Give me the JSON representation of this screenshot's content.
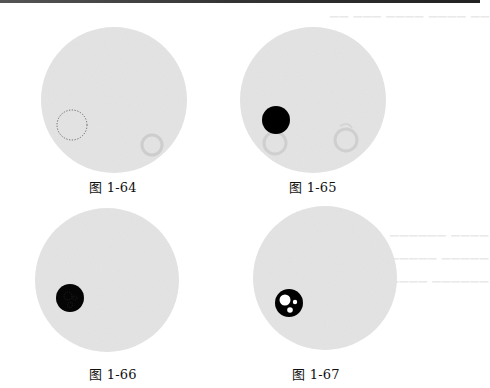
{
  "page": {
    "background": "#ffffff",
    "top_rule_color": "#333333"
  },
  "colors": {
    "disc_fill": "#e4e4e4",
    "disc_texture": "#dadada",
    "mark_black": "#000000",
    "hole_white": "#ffffff",
    "faint_ring": "#c9c9c9",
    "dashed_outline": "#555555"
  },
  "figures": [
    {
      "id": "fig-1-64",
      "caption": "图 1-64",
      "disc": {
        "cx": 114,
        "cy": 100,
        "r": 73
      },
      "mark": {
        "type": "dashed-circle",
        "cx": 72,
        "cy": 125,
        "r": 15
      },
      "faint_rings": [
        {
          "cx": 152,
          "cy": 145,
          "r": 10
        }
      ],
      "caption_pos": {
        "x": 113,
        "y": 184
      }
    },
    {
      "id": "fig-1-65",
      "caption": "图 1-65",
      "disc": {
        "cx": 313,
        "cy": 100,
        "r": 73
      },
      "mark": {
        "type": "filled-circle",
        "cx": 276,
        "cy": 120,
        "r": 14
      },
      "faint_rings": [
        {
          "cx": 275,
          "cy": 143,
          "r": 11
        },
        {
          "cx": 346,
          "cy": 140,
          "r": 11
        }
      ],
      "caption_pos": {
        "x": 313,
        "y": 184
      }
    },
    {
      "id": "fig-1-66",
      "caption": "图 1-66",
      "disc": {
        "cx": 107,
        "cy": 280,
        "r": 72
      },
      "mark": {
        "type": "filled-circle-with-texture",
        "cx": 70,
        "cy": 298,
        "r": 14
      },
      "faint_rings": [],
      "caption_pos": {
        "x": 113,
        "y": 372
      }
    },
    {
      "id": "fig-1-67",
      "caption": "图 1-67",
      "disc": {
        "cx": 325,
        "cy": 278,
        "r": 72
      },
      "mark": {
        "type": "filled-circle-with-holes",
        "cx": 289,
        "cy": 303,
        "r": 14,
        "holes": [
          {
            "dx": -4,
            "dy": -3,
            "r": 5.5
          },
          {
            "dx": 6,
            "dy": -1,
            "r": 2.2
          },
          {
            "dx": 1,
            "dy": 7,
            "r": 2.8
          }
        ]
      },
      "faint_rings": [],
      "caption_pos": {
        "x": 316,
        "y": 372
      }
    }
  ]
}
